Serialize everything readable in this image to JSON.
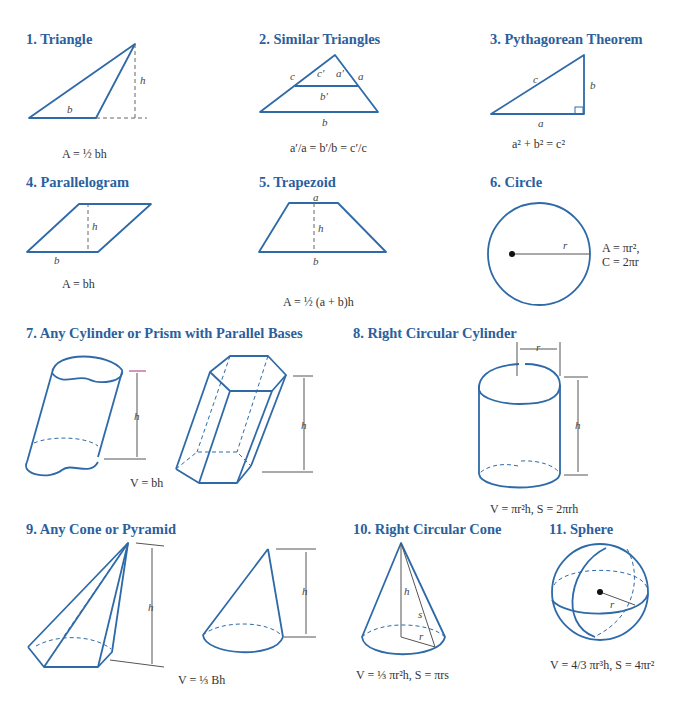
{
  "figures": [
    {
      "id": 1,
      "title": "1. Triangle",
      "formula": "A = ½ bh",
      "labels": [
        "b",
        "h"
      ]
    },
    {
      "id": 2,
      "title": "2. Similar Triangles",
      "formula": "a′/a = b′/b = c′/c",
      "labels": [
        "c",
        "c′",
        "a′",
        "a",
        "b′",
        "b"
      ]
    },
    {
      "id": 3,
      "title": "3. Pythagorean Theorem",
      "formula": "a² + b² = c²",
      "labels": [
        "c",
        "b",
        "a"
      ]
    },
    {
      "id": 4,
      "title": "4. Parallelogram",
      "formula": "A = bh",
      "labels": [
        "h",
        "b"
      ]
    },
    {
      "id": 5,
      "title": "5. Trapezoid",
      "formula": "A = ½ (a + b)h",
      "labels": [
        "a",
        "h",
        "b"
      ]
    },
    {
      "id": 6,
      "title": "6. Circle",
      "formula_line1": "A = πr²,",
      "formula_line2": "C = 2πr",
      "labels": [
        "r"
      ]
    },
    {
      "id": 7,
      "title": "7. Any Cylinder or Prism with Parallel Bases",
      "formula": "V = bh",
      "labels": [
        "h",
        "h"
      ]
    },
    {
      "id": 8,
      "title": "8. Right Circular Cylinder",
      "formula": "V = πr²h, S = 2πrh",
      "labels": [
        "r",
        "h"
      ]
    },
    {
      "id": 9,
      "title": "9. Any Cone or Pyramid",
      "formula": "V = ⅓ Bh",
      "labels": [
        "h",
        "h"
      ]
    },
    {
      "id": 10,
      "title": "10. Right Circular Cone",
      "formula": "V = ⅓ πr²h, S = πrs",
      "labels": [
        "h",
        "s",
        "r"
      ]
    },
    {
      "id": 11,
      "title": "11.  Sphere",
      "formula": "V = 4/3 πr³h, S = 4πr²",
      "labels": [
        "r"
      ]
    }
  ],
  "colors": {
    "title": "#2b5f9e",
    "stroke": "#2e6aa8",
    "dim": "#555555"
  }
}
